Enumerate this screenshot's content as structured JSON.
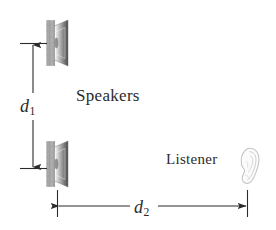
{
  "figure": {
    "background_color": "#ffffff",
    "ink_color": "#2b2b2b",
    "width": 276,
    "height": 230
  },
  "labels": {
    "speakers": "Speakers",
    "listener": "Listener"
  },
  "dimensions": {
    "d1": {
      "symbol": "d",
      "subscript": "1",
      "orientation": "vertical",
      "description": "separation between the two speakers"
    },
    "d2": {
      "symbol": "d",
      "subscript": "2",
      "orientation": "horizontal",
      "description": "distance from speaker plane to listener"
    }
  },
  "objects": {
    "speaker_top": {
      "icon": "loudspeaker-icon",
      "x": 44,
      "y": 20
    },
    "speaker_bottom": {
      "icon": "loudspeaker-icon",
      "x": 44,
      "y": 140
    },
    "listener_ear": {
      "icon": "ear-icon",
      "x": 238,
      "y": 148
    }
  },
  "colors": {
    "speaker_cone": "#8e8e8e",
    "speaker_baffle": "#bdbdbd",
    "ear_outline": "#c9c9c9",
    "arrow": "#2b2b2b"
  }
}
